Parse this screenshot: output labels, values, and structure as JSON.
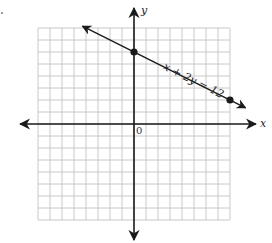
{
  "chart_data": {
    "type": "line",
    "title": "",
    "equation_label": "x + 2y = 12",
    "xlabel": "x",
    "ylabel": "y",
    "origin_label": "0",
    "xlim": [
      -8,
      8
    ],
    "ylim": [
      -8,
      8
    ],
    "grid": true,
    "grid_step": 1,
    "series": [
      {
        "name": "x + 2y = 12",
        "x": [
          -4.3,
          0,
          8,
          9.3
        ],
        "y": [
          8.15,
          6,
          2,
          1.35
        ],
        "marked_points": [
          {
            "x": 0,
            "y": 6
          },
          {
            "x": 8,
            "y": 2
          }
        ]
      }
    ]
  },
  "colors": {
    "grid": "#c8c8c8",
    "axis": "#1a1a1a",
    "line": "#1a1a1a"
  }
}
